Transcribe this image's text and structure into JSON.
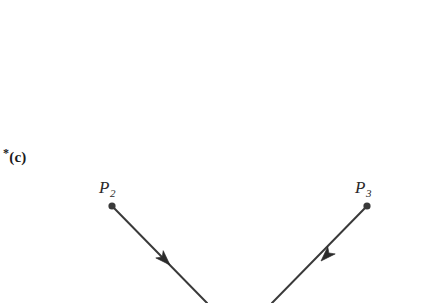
{
  "figure": {
    "background_color": "#ffffff",
    "width": 442,
    "height": 303,
    "part_label": {
      "marker": "*",
      "text": "(c)",
      "x": 3,
      "y": 146
    },
    "stroke_color": "#3a3a3a",
    "stroke_width": 2,
    "point_color": "#3a3a3a",
    "point_radius": 3.6,
    "points": [
      {
        "id": "P2",
        "label_base": "P",
        "label_sub": "2",
        "x": 112,
        "y": 206,
        "label_x": 99,
        "label_y": 178
      },
      {
        "id": "P3",
        "label_base": "P",
        "label_sub": "3",
        "x": 367,
        "y": 206,
        "label_x": 355,
        "label_y": 178
      }
    ],
    "edges": [
      {
        "id": "edge-to-p2",
        "from_x": 207,
        "from_y": 303,
        "to_x": 112,
        "to_y": 206,
        "direction": "up-left",
        "arrow_x": 170,
        "arrow_y": 265,
        "arrow_angle_deg": 225.6
      },
      {
        "id": "edge-to-p3",
        "from_x": 272,
        "from_y": 303,
        "to_x": 367,
        "to_y": 206,
        "direction": "up-right",
        "arrow_x": 321,
        "arrow_y": 261,
        "arrow_angle_deg": 314.4
      }
    ]
  }
}
